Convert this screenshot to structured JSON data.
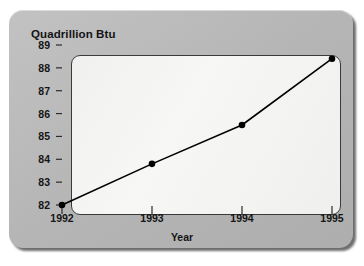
{
  "chart_data": {
    "type": "line",
    "title": "Quadrillion Btu",
    "xlabel": "Year",
    "ylabel": "",
    "x": [
      1992,
      1993,
      1994,
      1995
    ],
    "categories": [
      "1992",
      "1993",
      "1994",
      "1995"
    ],
    "values": [
      82.0,
      83.8,
      85.5,
      88.4
    ],
    "series": [
      {
        "name": "Energy consumption",
        "values": [
          82.0,
          83.8,
          85.5,
          88.4
        ]
      }
    ],
    "xtick_labels": [
      "1992",
      "1993",
      "1994",
      "1995"
    ],
    "ytick_labels": [
      "82",
      "83",
      "84",
      "85",
      "86",
      "87",
      "88",
      "89"
    ],
    "ytick_values": [
      82,
      83,
      84,
      85,
      86,
      87,
      88,
      89
    ],
    "ylim": [
      82,
      89
    ],
    "xlim": [
      1992,
      1995
    ],
    "grid": false,
    "legend": false,
    "marker": "filled-circle",
    "line_color": "#000000",
    "marker_color": "#000000",
    "plot_background": "#f4f4f2",
    "panel_background": "#b9b9b9"
  }
}
